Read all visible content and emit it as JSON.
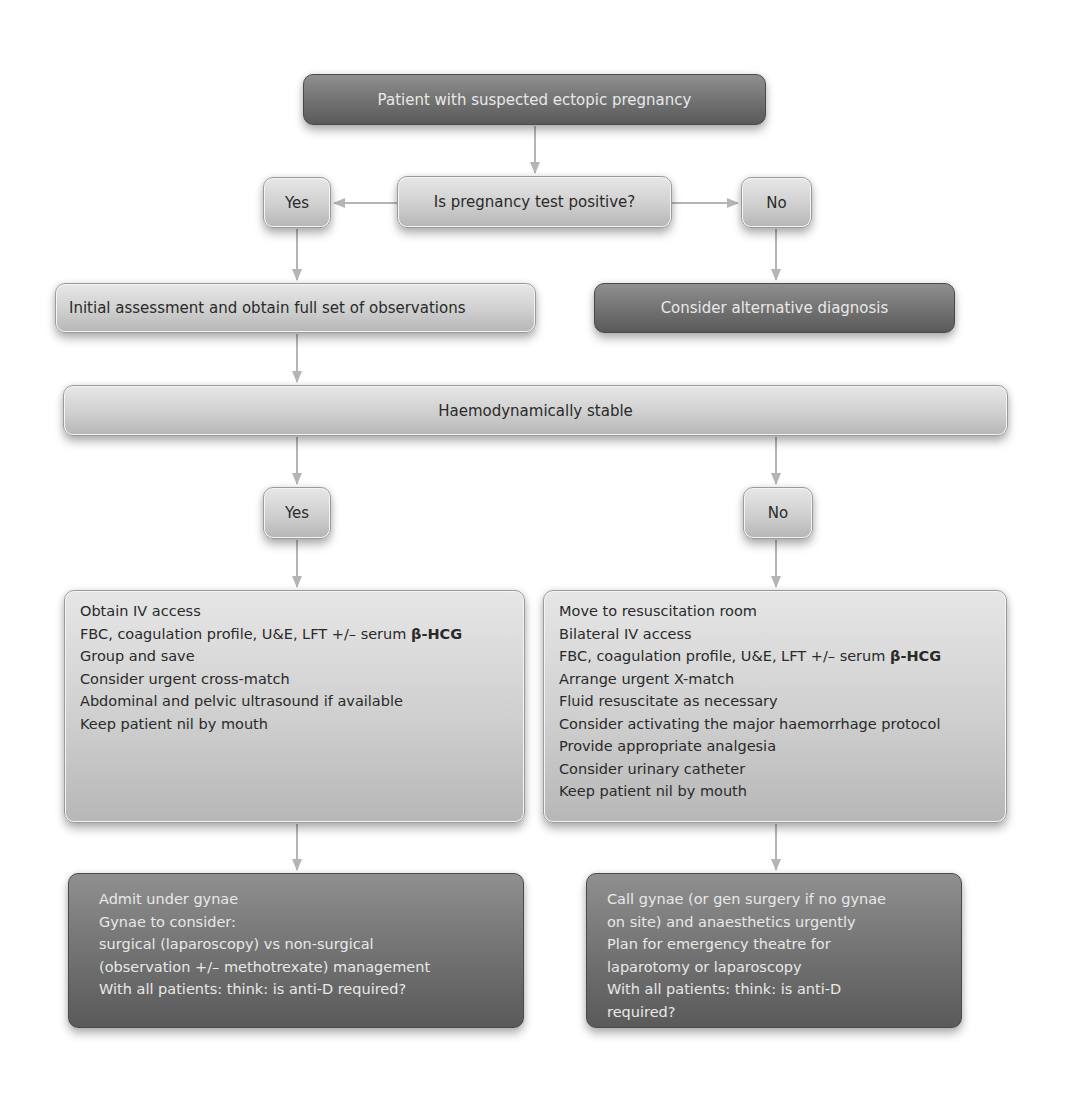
{
  "colors": {
    "dark_node": "#6e6e6e",
    "light_node": "#cfcfcf",
    "arrow": "#b5b5b5",
    "dark_text": "#2a2a2a",
    "light_text": "#e8e8e8"
  },
  "start": {
    "label": "Patient with suspected ectopic pregnancy"
  },
  "question1": {
    "label": "Is pregnancy test positive?"
  },
  "q1_yes": {
    "label": "Yes"
  },
  "q1_no": {
    "label": "No"
  },
  "initial_assessment": {
    "label": "Initial assessment and obtain full set of observations"
  },
  "alternative": {
    "label": "Consider alternative diagnosis"
  },
  "haemodynamic": {
    "label": "Haemodynamically stable"
  },
  "stable_yes": {
    "label": "Yes"
  },
  "stable_no": {
    "label": "No"
  },
  "stable_actions": {
    "items": [
      "Obtain IV access",
      "FBC, coagulation profile, U&E, LFT +/– serum ",
      "Group and save",
      "Consider urgent cross-match",
      "Abdominal and pelvic ultrasound if available",
      "Keep patient nil by mouth"
    ],
    "bold_suffix": "β-HCG"
  },
  "unstable_actions": {
    "items": [
      "Move to resuscitation room",
      "Bilateral IV access",
      "FBC, coagulation profile, U&E, LFT +/– serum ",
      "Arrange urgent X-match",
      "Fluid resuscitate as necessary",
      "Consider activating the major haemorrhage protocol",
      "Provide appropriate analgesia",
      "Consider urinary catheter",
      "Keep patient nil by mouth"
    ],
    "bold_suffix": "β-HCG"
  },
  "stable_outcome": {
    "items": [
      "Admit under gynae",
      "Gynae to consider:",
      "surgical (laparoscopy) vs non-surgical",
      "(observation +/– methotrexate) management",
      "With all patients: think: is anti-D required?"
    ]
  },
  "unstable_outcome": {
    "items": [
      "Call gynae (or gen surgery if no gynae",
      "on site) and anaesthetics urgently",
      "Plan for emergency theatre for",
      "laparotomy or laparoscopy",
      "With all patients: think: is anti-D",
      "required?"
    ]
  }
}
